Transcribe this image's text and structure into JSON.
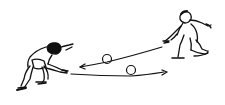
{
  "illustration": {
    "description": "Line drawing of two crouching people rolling two balls back and forth along the ground",
    "ink_color": "#111111",
    "background_color": "#ffffff",
    "figures": [
      {
        "id": "left-person",
        "pose": "crouching, arms reaching forward to receive ball"
      },
      {
        "id": "right-person",
        "pose": "kneeling, arm extended after rolling ball"
      }
    ],
    "balls": [
      {
        "id": "upper-ball",
        "cx": 107,
        "cy": 59
      },
      {
        "id": "lower-ball",
        "cx": 131,
        "cy": 70
      }
    ],
    "arrows": [
      {
        "id": "arrow-right-to-left",
        "direction": "left"
      },
      {
        "id": "arrow-left-to-right",
        "direction": "right"
      }
    ]
  }
}
